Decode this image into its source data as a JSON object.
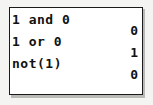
{
  "device": {
    "kind": "graphing-calculator-home-screen",
    "screen_background": "#ffffff",
    "text_color": "#111111",
    "border_color": "#1b1b1b",
    "page_background": "#f4f4f2"
  },
  "screen": {
    "rows": [
      {
        "entry": "1 and 0",
        "answer": "0"
      },
      {
        "entry": "1 or 0",
        "answer": "1"
      },
      {
        "entry": "not(1)",
        "answer": "0"
      }
    ]
  }
}
